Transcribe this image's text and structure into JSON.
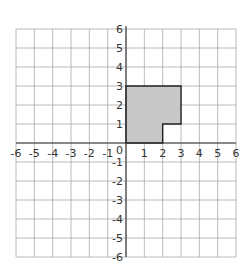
{
  "diagram": {
    "type": "coordinate-grid",
    "x_range": [
      -6,
      6
    ],
    "y_range": [
      -6,
      6
    ],
    "x_tick_labels": [
      "-6",
      "-5",
      "-4",
      "-3",
      "-2",
      "-1",
      "0",
      "1",
      "2",
      "3",
      "4",
      "5",
      "6"
    ],
    "y_tick_labels": [
      "6",
      "5",
      "4",
      "3",
      "2",
      "1",
      "-1",
      "-2",
      "-3",
      "-4",
      "-5",
      "-6"
    ],
    "origin_label": "0",
    "shape": {
      "name": "L-shaped polygon",
      "vertices": [
        [
          0,
          0
        ],
        [
          2,
          0
        ],
        [
          2,
          1
        ],
        [
          3,
          1
        ],
        [
          3,
          3
        ],
        [
          0,
          3
        ]
      ],
      "fill": "#c8c8c8",
      "stroke": "#222222"
    },
    "colors": {
      "grid": "#a8a8a8",
      "axis": "#333333",
      "background": "#ffffff"
    }
  }
}
